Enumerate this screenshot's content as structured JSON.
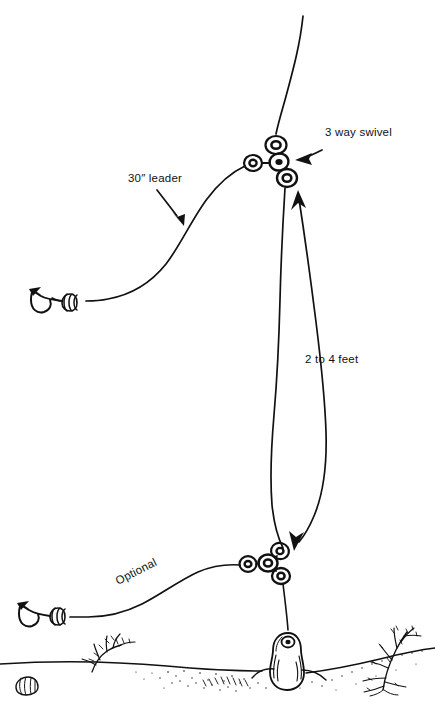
{
  "diagram": {
    "background_color": "#ffffff",
    "ink_color": "#111111",
    "width": 435,
    "height": 709,
    "labels": {
      "top_swivel": "3 way swivel",
      "leader": "30″ leader",
      "dropper_length": "2 to 4 feet",
      "optional_leader": "Optional"
    },
    "components": {
      "main_line": "main fishing line",
      "upper_swivel": "3 way swivel",
      "lower_swivel": "3 way swivel",
      "upper_leader": "30 inch leader",
      "lower_leader": "optional 30 inch leader",
      "upper_hook": "baited hook",
      "lower_hook": "baited hook",
      "sinker": "pear sinker",
      "seabed": "sandy seabed",
      "shell": "seashell",
      "seaweed_left": "seaweed",
      "seaweed_right": "seaweed"
    }
  }
}
